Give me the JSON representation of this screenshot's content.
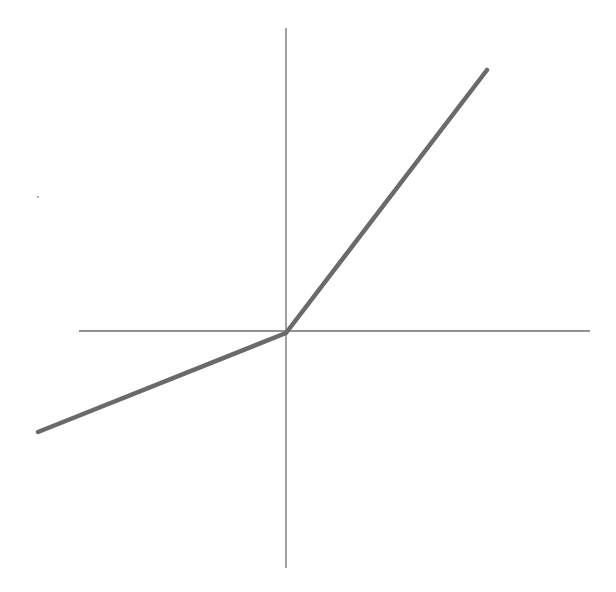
{
  "diagram": {
    "type": "piecewise-linear-function",
    "colors": {
      "background": "#ffffff",
      "axis": "#6e6e6e",
      "curve": "#6a6a6a"
    },
    "axes": {
      "x_axis": {
        "x1": 79,
        "y1": 331,
        "x2": 590,
        "y2": 331,
        "width": 1.3
      },
      "y_axis": {
        "x1": 286,
        "y1": 28,
        "x2": 286,
        "y2": 568,
        "width": 1.3
      }
    },
    "curve": {
      "points": "38,432 286,333 487,70",
      "width": 4.5
    },
    "speck": {
      "cx": 38,
      "cy": 197,
      "r": 1
    }
  }
}
